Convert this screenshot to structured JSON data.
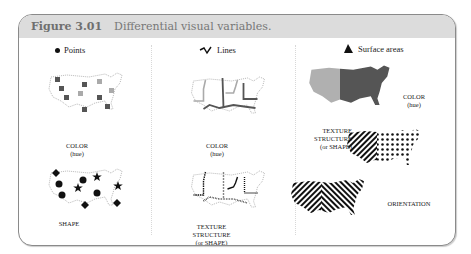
{
  "figure": {
    "number": "Figure 3.01",
    "title": "Differential visual variables."
  },
  "columns": [
    {
      "title": "Points",
      "icon": "dot-icon",
      "panels": [
        {
          "label_lines": [
            "COLOR",
            "(hue)"
          ]
        },
        {
          "label_lines": [
            "SHAPE"
          ]
        }
      ]
    },
    {
      "title": "Lines",
      "icon": "zigzag-line-icon",
      "panels": [
        {
          "label_lines": [
            "COLOR",
            "(hue)"
          ]
        },
        {
          "label_lines": [
            "TEXTURE",
            "STRUCTURE",
            "(or SHAPE)"
          ]
        }
      ]
    },
    {
      "title": "Surface areas",
      "icon": "triangle-area-icon",
      "panels": [
        {
          "label_lines": [
            "COLOR",
            "(hue)"
          ]
        },
        {
          "label_lines": [
            "TEXTURE",
            "STRUCTURE",
            "(or SHAPE)"
          ]
        },
        {
          "label_lines": [
            "ORIENTATION"
          ]
        }
      ]
    }
  ],
  "colors": {
    "header_bg": "#dcdcdc",
    "dark_gray": "#555555",
    "light_gray": "#b5b5b5",
    "black": "#111111"
  }
}
